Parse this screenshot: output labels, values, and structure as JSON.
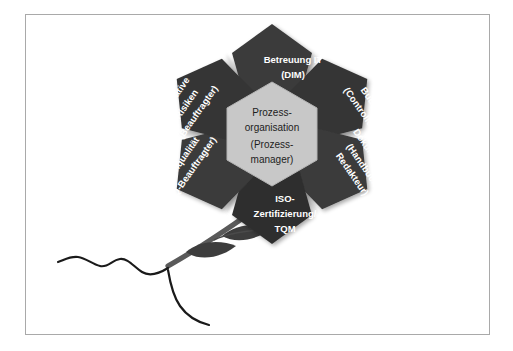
{
  "figure": {
    "kind": "flower-diagram",
    "border_color": "#a9a9a9",
    "background_color": "#ffffff"
  },
  "colors": {
    "petal_fill": "#3a3a3a",
    "petal_fill_dark": "#2e2e2e",
    "petal_text": "#ffffff",
    "center_fill": "#c8c8c8",
    "center_text": "#1d1d1d",
    "ray_fill": "#cfcfcf",
    "stem": "#5a5a5a",
    "leaf": "#3d3d3d",
    "root": "#1a1a1a"
  },
  "center": {
    "name": "prozessorganisation",
    "lines": [
      "Prozess-",
      "organisation",
      "(Prozess-",
      "manager)"
    ]
  },
  "petals": [
    {
      "id": "betreuung-it",
      "lines": [
        "Betreuung IT",
        "(DIM)"
      ],
      "angle_deg": 0,
      "text_rotation_deg": 0,
      "position": "top"
    },
    {
      "id": "budget",
      "lines": [
        "Budget",
        "(Controller)"
      ],
      "angle_deg": 60,
      "text_rotation_deg": 60,
      "position": "upper-right"
    },
    {
      "id": "dokumentation",
      "lines": [
        "Dokumentation",
        "(Handbuch-",
        "Redakteur)"
      ],
      "angle_deg": 120,
      "text_rotation_deg": 60,
      "position": "lower-right"
    },
    {
      "id": "iso-zertifizierung-tqm",
      "lines": [
        "ISO-",
        "Zertifizierung/",
        "TQM"
      ],
      "angle_deg": 180,
      "text_rotation_deg": 0,
      "position": "bottom"
    },
    {
      "id": "datenqualitaet",
      "lines": [
        "Datenqualität",
        "(DQ-Beauftragter)"
      ],
      "angle_deg": 240,
      "text_rotation_deg": -60,
      "position": "lower-left"
    },
    {
      "id": "operative-risiken",
      "lines": [
        "Operative",
        "Risiken",
        "(Beauftragter)"
      ],
      "angle_deg": 300,
      "text_rotation_deg": -60,
      "position": "upper-left"
    }
  ],
  "stem": {
    "name": "flower-stem",
    "leaves": [
      "leaf-upper-right",
      "leaf-lower-left"
    ],
    "roots": [
      "root-left",
      "root-down"
    ]
  }
}
